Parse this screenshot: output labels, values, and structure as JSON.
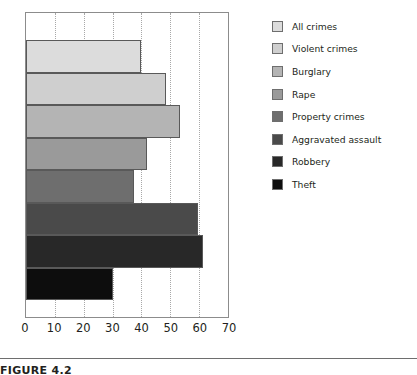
{
  "caption": {
    "text": "FIGURE 4.2"
  },
  "chart_data": {
    "type": "bar",
    "orientation": "horizontal",
    "title": "",
    "xlabel": "",
    "ylabel": "",
    "xlim": [
      0,
      70
    ],
    "xticks": [
      0,
      10,
      20,
      30,
      40,
      50,
      60,
      70
    ],
    "grid": true,
    "grid_axis": "x",
    "legend_position": "right",
    "categories": [
      "All crimes",
      "Violent crimes",
      "Burglary",
      "Rape",
      "Property crimes",
      "Aggravated assault",
      "Robbery",
      "Theft"
    ],
    "values": [
      40,
      48.5,
      53.5,
      42,
      37.5,
      59.5,
      61.5,
      30
    ],
    "colors": [
      "#dcdcdc",
      "#cfcfcf",
      "#b4b4b4",
      "#9a9a9a",
      "#6e6e6e",
      "#4a4a4a",
      "#282828",
      "#0d0d0d"
    ]
  }
}
